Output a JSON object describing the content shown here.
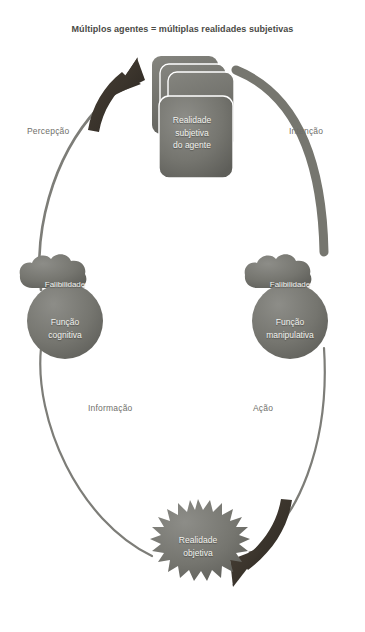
{
  "diagram": {
    "title": "Múltiplos agentes = múltiplas realidades subjetivas",
    "colors": {
      "background": "#ffffff",
      "shape_gray": "#6f6f6b",
      "shape_gray_light": "#8a8a85",
      "arrow_dark": "#3b342c",
      "curve_gray": "#7d7d78",
      "label_text": "#6f6f6b",
      "title_text": "#4a4a46",
      "node_text": "#f2f2ee"
    },
    "edge_labels": {
      "percepcao": "Percepção",
      "intencao": "Intenção",
      "informacao": "Informação",
      "acao": "Ação"
    },
    "nodes": {
      "cards": {
        "name": "subjective-reality-card-stack",
        "text": "Realidade\nsubjetiva\ndo agente",
        "count": 4
      },
      "left": {
        "cloud": "Falibilidade",
        "circle": "Função\ncognitiva"
      },
      "right": {
        "cloud": "Falibilidade",
        "circle": "Função\nmanipulativa"
      },
      "burst": {
        "name": "objective-reality-starburst",
        "text": "Realidade\nobjetiva",
        "points": 28
      }
    },
    "arrows": {
      "perception_arrow": "curved-arrow-up-right",
      "intention_curve": "curved-line-down-right",
      "action_arrow": "curved-arrow-down-left",
      "information_curve": "curved-line-up-left"
    }
  }
}
